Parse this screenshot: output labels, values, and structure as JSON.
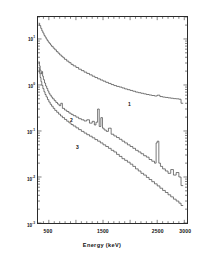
{
  "figure": {
    "background": "#ffffff",
    "line_color": "#333333",
    "axis_color": "#2b2b2b"
  },
  "axes": {
    "x_title": "Energy (keV)",
    "y_title": "counts keV⁻¹ 1000 min⁻¹",
    "x_ticks": [
      {
        "value": 500,
        "label": "500"
      },
      {
        "value": 1000,
        "label": "1000"
      },
      {
        "value": 1500,
        "label": "1500"
      },
      {
        "value": 2000,
        "label": "2000"
      },
      {
        "value": 2500,
        "label": "2500"
      },
      {
        "value": 3000,
        "label": "3000"
      }
    ],
    "x_labeled": [
      "500",
      "1500",
      "2500",
      "3000"
    ],
    "y_ticks": [
      {
        "exp": "1",
        "mantissa": "10"
      },
      {
        "exp": "0",
        "mantissa": "10"
      },
      {
        "exp": "-1",
        "mantissa": "10"
      },
      {
        "exp": "-2",
        "mantissa": "10"
      },
      {
        "exp": "-3",
        "mantissa": "10"
      }
    ]
  },
  "annotations": [
    {
      "name": "curve-label-1",
      "text": "1",
      "x": 128,
      "y": 101
    },
    {
      "name": "curve-label-2",
      "text": "2",
      "x": 70,
      "y": 117
    },
    {
      "name": "curve-label-3",
      "text": "3",
      "x": 76,
      "y": 144
    }
  ],
  "chart_data": {
    "type": "line",
    "title": "",
    "xlabel": "Energy (keV)",
    "ylabel": "counts keV⁻¹ 1000 min⁻¹",
    "xlim": [
      300,
      3050
    ],
    "ylim": [
      0.001,
      30
    ],
    "yscale": "log",
    "xscale": "linear",
    "grid": false,
    "legend": "inline-labels",
    "series": [
      {
        "name": "1",
        "label_text": "1",
        "style": "step",
        "x": [
          310,
          330,
          350,
          370,
          390,
          410,
          430,
          450,
          470,
          490,
          510,
          530,
          550,
          580,
          610,
          640,
          670,
          700,
          730,
          760,
          790,
          830,
          870,
          910,
          950,
          1000,
          1050,
          1100,
          1150,
          1200,
          1250,
          1300,
          1350,
          1400,
          1450,
          1500,
          1550,
          1600,
          1650,
          1700,
          1750,
          1800,
          1850,
          1900,
          1950,
          2000,
          2050,
          2100,
          2150,
          2200,
          2250,
          2300,
          2350,
          2400,
          2450,
          2500,
          2550,
          2600,
          2650,
          2700,
          2750,
          2800,
          2850,
          2900,
          2940
        ],
        "y": [
          22.0,
          19.5,
          17.0,
          15.0,
          13.5,
          12.0,
          11.0,
          10.0,
          9.2,
          8.5,
          8.0,
          7.4,
          6.9,
          6.3,
          5.8,
          5.3,
          4.9,
          4.5,
          4.2,
          3.9,
          3.6,
          3.3,
          3.05,
          2.8,
          2.6,
          2.4,
          2.2,
          2.05,
          1.9,
          1.78,
          1.66,
          1.55,
          1.45,
          1.36,
          1.28,
          1.21,
          1.14,
          1.08,
          1.02,
          0.97,
          0.93,
          0.9,
          0.86,
          0.82,
          0.79,
          0.76,
          0.73,
          0.7,
          0.68,
          0.66,
          0.64,
          0.62,
          0.605,
          0.59,
          0.575,
          0.6,
          0.56,
          0.545,
          0.535,
          0.525,
          0.515,
          0.505,
          0.5,
          0.49,
          0.4
        ]
      },
      {
        "name": "2",
        "label_text": "2",
        "style": "step",
        "x": [
          310,
          325,
          340,
          355,
          370,
          385,
          400,
          420,
          440,
          460,
          480,
          500,
          520,
          545,
          570,
          600,
          630,
          660,
          690,
          720,
          750,
          790,
          830,
          870,
          910,
          950,
          1000,
          1050,
          1100,
          1150,
          1200,
          1250,
          1300,
          1340,
          1370,
          1400,
          1430,
          1460,
          1490,
          1520,
          1560,
          1600,
          1650,
          1700,
          1750,
          1800,
          1850,
          1900,
          1950,
          2000,
          2050,
          2100,
          2150,
          2200,
          2250,
          2300,
          2350,
          2400,
          2450,
          2480,
          2500,
          2530,
          2560,
          2600,
          2650,
          2700,
          2750,
          2800,
          2850,
          2900,
          2940
        ],
        "y": [
          3.2,
          2.6,
          2.1,
          1.75,
          1.95,
          1.55,
          1.3,
          1.1,
          0.95,
          0.84,
          0.74,
          0.66,
          0.6,
          0.545,
          0.5,
          0.455,
          0.415,
          0.385,
          0.355,
          0.4,
          0.31,
          0.285,
          0.265,
          0.245,
          0.23,
          0.215,
          0.2,
          0.185,
          0.175,
          0.165,
          0.175,
          0.148,
          0.162,
          0.135,
          0.155,
          0.3,
          0.125,
          0.195,
          0.115,
          0.105,
          0.098,
          0.115,
          0.085,
          0.078,
          0.072,
          0.066,
          0.06,
          0.055,
          0.05,
          0.046,
          0.042,
          0.038,
          0.035,
          0.032,
          0.029,
          0.027,
          0.024,
          0.022,
          0.02,
          0.055,
          0.06,
          0.02,
          0.017,
          0.015,
          0.0135,
          0.012,
          0.0145,
          0.011,
          0.0125,
          0.01,
          0.0065
        ]
      },
      {
        "name": "3",
        "label_text": "3",
        "style": "step",
        "x": [
          310,
          325,
          340,
          355,
          370,
          390,
          410,
          430,
          450,
          475,
          500,
          525,
          550,
          580,
          610,
          645,
          680,
          715,
          750,
          790,
          830,
          870,
          910,
          950,
          1000,
          1050,
          1100,
          1150,
          1200,
          1250,
          1300,
          1350,
          1400,
          1450,
          1500,
          1550,
          1600,
          1650,
          1700,
          1750,
          1800,
          1850,
          1900,
          1950,
          2000,
          2050,
          2100,
          2150,
          2200,
          2250,
          2300,
          2350,
          2400,
          2450,
          2500,
          2550,
          2600,
          2650,
          2700,
          2750,
          2800,
          2850,
          2900,
          2940
        ],
        "y": [
          2.4,
          1.8,
          1.45,
          1.18,
          0.98,
          0.83,
          0.71,
          0.62,
          0.55,
          0.48,
          0.425,
          0.38,
          0.345,
          0.31,
          0.28,
          0.255,
          0.232,
          0.212,
          0.195,
          0.178,
          0.163,
          0.15,
          0.138,
          0.128,
          0.117,
          0.107,
          0.098,
          0.09,
          0.083,
          0.077,
          0.071,
          0.065,
          0.06,
          0.055,
          0.05,
          0.046,
          0.042,
          0.038,
          0.035,
          0.031,
          0.028,
          0.025,
          0.023,
          0.021,
          0.019,
          0.017,
          0.015,
          0.0135,
          0.012,
          0.011,
          0.0098,
          0.0088,
          0.0079,
          0.0071,
          0.0064,
          0.0057,
          0.0051,
          0.0046,
          0.0041,
          0.0037,
          0.0033,
          0.003,
          0.0027,
          0.0024
        ]
      }
    ]
  }
}
